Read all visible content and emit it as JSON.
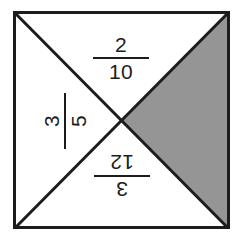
{
  "figure": {
    "name": "fraction-square-diagram",
    "background_color": "#ffffff",
    "square": {
      "outline_color": "#1c1c1c",
      "fill_color": "#ffffff",
      "border_width": 3,
      "left": 13,
      "top": 11,
      "right": 229,
      "bottom": 229,
      "center_x": 121,
      "center_y": 120
    },
    "diagonals": {
      "color": "#1c1c1c",
      "width": 3,
      "count": 2
    },
    "shaded_region": {
      "position": "right",
      "fill_color": "#959595",
      "outline_color": "#1c1c1c",
      "label": "shaded-triangle-right"
    }
  },
  "labels": [
    {
      "id": "top",
      "region": "top-triangle",
      "numerator": "2",
      "denominator": "10",
      "text": "2/10",
      "rotation_degrees": 0,
      "orientation": "upright"
    },
    {
      "id": "left",
      "region": "left-triangle",
      "numerator": "3",
      "denominator": "5",
      "text": "3/5",
      "rotation_degrees": -90,
      "orientation": "rotated-90-counter-clockwise"
    },
    {
      "id": "bottom",
      "region": "bottom-triangle",
      "numerator": "3",
      "denominator": "12",
      "text": "3/12",
      "rotation_degrees": 180,
      "orientation": "upside-down"
    }
  ]
}
